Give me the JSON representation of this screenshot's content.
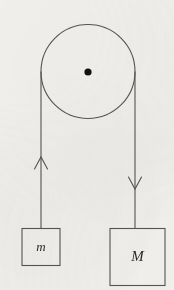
{
  "figure": {
    "name": "atwood-machine-pulley-diagram",
    "width": 174,
    "height": 290,
    "background_color": "#f1f0ed",
    "ink_color": "#555555",
    "label_color": "#2b2b2b",
    "axle_color": "#111111"
  },
  "pulley": {
    "name": "pulley-wheel",
    "center_x": 88,
    "center_y": 71.5,
    "radius": 47,
    "stroke_width": 1.1,
    "axle": {
      "name": "pulley-axle-dot",
      "center_x": 88,
      "center_y": 72,
      "radius": 3.6
    }
  },
  "ropes": [
    {
      "name": "rope-left",
      "side": "left",
      "x": 41,
      "y_top": 71.5,
      "y_bottom": 229,
      "stroke_width": 1.1,
      "arrow": {
        "name": "tension-arrow-up-left",
        "direction": "up",
        "tip_x": 41,
        "tip_y": 157,
        "half_width": 6.5,
        "length": 12
      }
    },
    {
      "name": "rope-right",
      "side": "right",
      "x": 135,
      "y_top": 71.5,
      "y_bottom": 229,
      "stroke_width": 1.1,
      "arrow": {
        "name": "motion-arrow-down-right",
        "direction": "down",
        "tip_x": 135,
        "tip_y": 189,
        "half_width": 6.5,
        "length": 12
      }
    }
  ],
  "masses": [
    {
      "name": "mass-block-small",
      "label": "m",
      "x": 22,
      "y": 228.5,
      "width": 38,
      "height": 37,
      "label_x": 41,
      "label_y": 248,
      "font_size": 13,
      "stroke_width": 1.1
    },
    {
      "name": "mass-block-large",
      "label": "M",
      "x": 110,
      "y": 228.5,
      "width": 55,
      "height": 57,
      "label_x": 137.5,
      "label_y": 258,
      "font_size": 15,
      "stroke_width": 1.1
    }
  ]
}
